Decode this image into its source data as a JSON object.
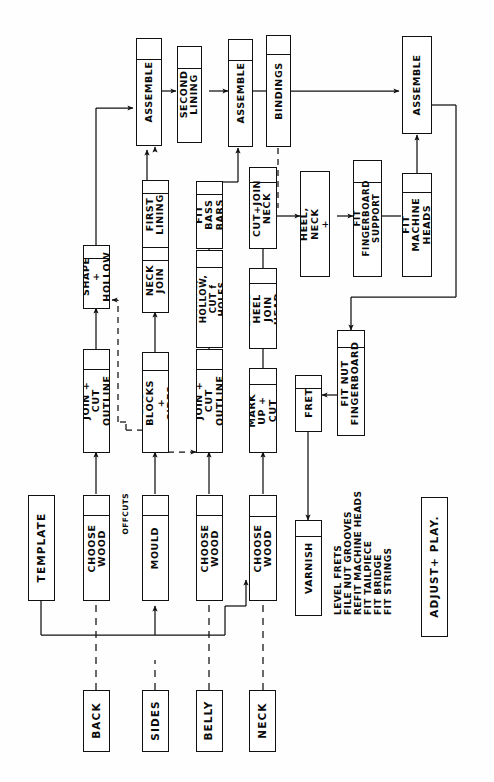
{
  "diagram": {
    "orientation": "rotated-90-ccw",
    "stroke_color": "#111111",
    "background_color": "#ffffff"
  },
  "materials": [
    {
      "label": "BACK"
    },
    {
      "label": "SIDES"
    },
    {
      "label": "BELLY"
    },
    {
      "label": "NECK"
    }
  ],
  "nodes": {
    "template": "TEMPLATE",
    "back_choose_wood": "CHOOSE\nWOOD",
    "back_join_cut_outline": "JOIN + CUT\nOUTLINE",
    "back_shape_hollow": "SHAPE +\nHOLLOW",
    "mould": "MOULD",
    "end_blocks_sides": "END BLOCKS\n+ SIDES",
    "neck_join": "NECK\nJOIN",
    "first_lining": "FIRST\nLINING",
    "assemble_1": "ASSEMBLE",
    "second_lining": "SECOND\nLINING",
    "belly_choose_wood": "CHOOSE\nWOOD",
    "belly_join_cut_outline": "JOIN + CUT\nOUTLINE",
    "shape_hollow_cut_f_holes": "SHAPE, HOLLOW,\nCUT f HOLES",
    "fit_bass_bars": "FIT BASS\nBARS",
    "assemble_2": "ASSEMBLE",
    "bindings": "BINDINGS",
    "neck_choose_wood": "CHOOSE\nWOOD",
    "mark_up_cut": "MARK UP +\nCUT",
    "build_heel_join_head": "BUILD HEEL\nJOIN HEAD",
    "cut_join_neck": "CUT+JOIN\nNECK",
    "shape_heel_neck_head": "SHAPE HEEL,\nNECK + HEAD",
    "fit_fingerboard_support": "FIT FINGERBOARD\nSUPPORT",
    "fit_machine_heads": "FIT MACHINE\nHEADS",
    "assemble_3": "ASSEMBLE",
    "fit_nut_fingerboard": "FIT NUT\nFINGERBOARD",
    "fret": "FRET",
    "varnish": "VARNISH",
    "adjust_play": "ADJUST+ PLAY."
  },
  "annotations": {
    "offcuts": "OFFCUTS"
  },
  "checklist": [
    "LEVEL FRETS",
    "FILE NUT GROOVES",
    "REFIT MACHINE HEADS",
    "FIT   TAILPIECE",
    "FIT   BRIDGE",
    "FIT   STRINGS"
  ]
}
